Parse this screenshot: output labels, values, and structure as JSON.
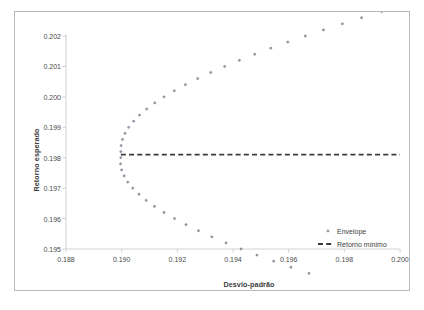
{
  "chart_data": {
    "type": "scatter",
    "title": "",
    "xlabel": "Desvio-padrão",
    "ylabel": "Retorno esperado",
    "xlim": [
      0.188,
      0.2
    ],
    "ylim": [
      0.195,
      0.202
    ],
    "xticks": [
      "0.188",
      "0.190",
      "0.192",
      "0.194",
      "0.196",
      "0.198",
      "0.200"
    ],
    "xtick_values": [
      0.188,
      0.19,
      0.192,
      0.194,
      0.196,
      0.198,
      0.2
    ],
    "yticks": [
      "0.195",
      "0.196",
      "0.197",
      "0.198",
      "0.199",
      "0.200",
      "0.201",
      "0.202"
    ],
    "ytick_values": [
      0.195,
      0.196,
      0.197,
      0.198,
      0.199,
      0.2,
      0.201,
      0.202
    ],
    "grid": false,
    "legend_position": "inside-lower-right",
    "marker_color": "#8e8e9e",
    "line_color": "#3a3a3a",
    "series": [
      {
        "name": "Envelope",
        "type": "scatter",
        "marker": "dot",
        "color": "#8e8e9e",
        "points": [
          [
            0.18997,
            0.1982
          ],
          [
            0.18998,
            0.1984
          ],
          [
            0.19003,
            0.1986
          ],
          [
            0.19012,
            0.1988
          ],
          [
            0.19025,
            0.199
          ],
          [
            0.19043,
            0.1992
          ],
          [
            0.19064,
            0.1994
          ],
          [
            0.1909,
            0.1996
          ],
          [
            0.19119,
            0.1998
          ],
          [
            0.19152,
            0.2
          ],
          [
            0.19189,
            0.2002
          ],
          [
            0.19229,
            0.2004
          ],
          [
            0.19273,
            0.2006
          ],
          [
            0.1932,
            0.2008
          ],
          [
            0.1937,
            0.201
          ],
          [
            0.19423,
            0.2012
          ],
          [
            0.19478,
            0.2014
          ],
          [
            0.19536,
            0.2016
          ],
          [
            0.19597,
            0.2018
          ],
          [
            0.1966,
            0.202
          ],
          [
            0.19725,
            0.2022
          ],
          [
            0.19793,
            0.2024
          ],
          [
            0.19862,
            0.2026
          ],
          [
            0.19934,
            0.2028
          ],
          [
            0.18997,
            0.198
          ],
          [
            0.18996,
            0.1978
          ],
          [
            0.19,
            0.1976
          ],
          [
            0.19009,
            0.1974
          ],
          [
            0.19022,
            0.1972
          ],
          [
            0.1904,
            0.197
          ],
          [
            0.19062,
            0.1968
          ],
          [
            0.19088,
            0.1966
          ],
          [
            0.19118,
            0.1964
          ],
          [
            0.19152,
            0.1962
          ],
          [
            0.1919,
            0.196
          ],
          [
            0.19231,
            0.1958
          ],
          [
            0.19276,
            0.1956
          ],
          [
            0.19324,
            0.1954
          ],
          [
            0.19375,
            0.1952
          ],
          [
            0.19429,
            0.195
          ],
          [
            0.19486,
            0.1948
          ],
          [
            0.19546,
            0.1946
          ],
          [
            0.19608,
            0.1944
          ],
          [
            0.19673,
            0.1942
          ]
        ]
      },
      {
        "name": "Retorno mínimo",
        "type": "line",
        "style": "dashed",
        "color": "#3a3a3a",
        "y": 0.1981,
        "x_start": 0.18997,
        "x_end": 0.2
      }
    ]
  },
  "legend": {
    "items": [
      {
        "label": "Envelope",
        "marker": "dot"
      },
      {
        "label": "Retorno mínimo",
        "marker": "dashed-line"
      }
    ]
  }
}
